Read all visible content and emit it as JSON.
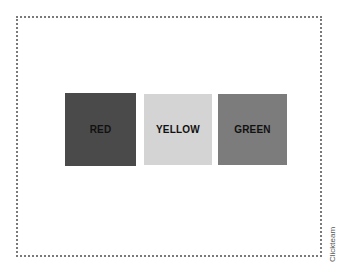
{
  "swatches": [
    {
      "label": "RED",
      "color": "#4a4a4a"
    },
    {
      "label": "YELLOW",
      "color": "#d4d4d4"
    },
    {
      "label": "GREEN",
      "color": "#7c7c7c"
    }
  ],
  "credit": "Clickteam"
}
